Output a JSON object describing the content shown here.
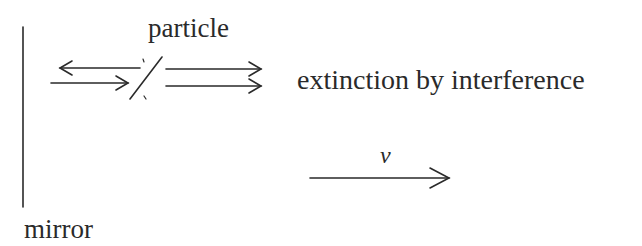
{
  "diagram": {
    "labels": {
      "particle": "particle",
      "extinction": "extinction by interference",
      "velocity": "v",
      "mirror": "mirror"
    },
    "elements": {
      "mirror_line": "vertical line representing mirror",
      "incident_arrow": "rightward arrow toward particle",
      "reflected_arrow": "leftward arrow from particle toward mirror",
      "particle_line": "slanted line representing the particle",
      "transmitted_arrows": "two parallel rightward arrows beyond particle",
      "velocity_arrow": "rightward arrow labeled v"
    },
    "colors": {
      "stroke": "#2a2a2a",
      "background": "#ffffff"
    }
  }
}
